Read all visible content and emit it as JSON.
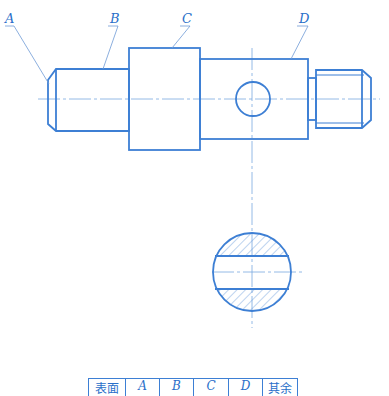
{
  "drawing": {
    "type": "mechanical-shaft-drawing",
    "line_color": "#3d7fd4",
    "center_line_color": "#7aa8e0",
    "hatch_color": "#5a90d8",
    "labels": [
      {
        "id": "A",
        "text": "A"
      },
      {
        "id": "B",
        "text": "B"
      },
      {
        "id": "C",
        "text": "C"
      },
      {
        "id": "D",
        "text": "D"
      }
    ],
    "views": [
      "main-view",
      "section-view"
    ]
  },
  "surface_table": {
    "headers": [
      "表面",
      "A",
      "B",
      "C",
      "D",
      "其余"
    ]
  }
}
